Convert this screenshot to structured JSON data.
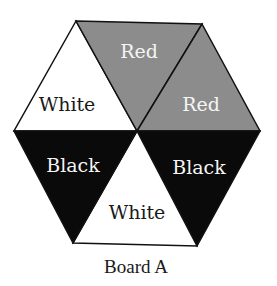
{
  "board": {
    "caption": "Board A",
    "colors": {
      "white": "#ffffff",
      "red": "#8c8c8c",
      "black": "#0a0a0a",
      "stroke": "#111111",
      "light_text": "#f5f5f5",
      "dark_text": "#1a1a1a"
    },
    "triangles": [
      {
        "position": "top-left",
        "label": "White",
        "fill": "white"
      },
      {
        "position": "top",
        "label": "Red",
        "fill": "red"
      },
      {
        "position": "top-right",
        "label": "Red",
        "fill": "red"
      },
      {
        "position": "bottom-right",
        "label": "Black",
        "fill": "black"
      },
      {
        "position": "bottom",
        "label": "White",
        "fill": "white"
      },
      {
        "position": "bottom-left",
        "label": "Black",
        "fill": "black"
      }
    ]
  }
}
